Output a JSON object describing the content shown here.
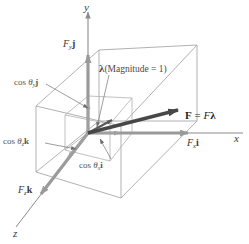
{
  "figure": {
    "background_color": "#ffffff",
    "axis_color": "#8c8c8c",
    "box_color": "#a8a8a8",
    "gray_arrow_color": "#9a9a9a",
    "dark_arrow_color": "#4a4a4a",
    "leader_color": "#7d7d7d"
  },
  "axes": {
    "x_label": "x",
    "y_label": "y",
    "z_label": "z"
  },
  "components": {
    "fx_label_prefix": "F",
    "fx_label_sub": "x",
    "fx_label_unit": "i",
    "fy_label_prefix": "F",
    "fy_label_sub": "y",
    "fy_label_unit": "j",
    "fz_label_prefix": "F",
    "fz_label_sub": "z",
    "fz_label_unit": "k"
  },
  "direction_cosines": {
    "cos_x_prefix": "cos ",
    "cos_x_theta": "θ",
    "cos_x_sub": "x",
    "cos_x_unit": "i",
    "cos_y_prefix": "cos ",
    "cos_y_theta": "θ",
    "cos_y_sub": "y",
    "cos_y_unit": "j",
    "cos_z_prefix": "cos ",
    "cos_z_theta": "θ",
    "cos_z_sub": "z",
    "cos_z_unit": "k"
  },
  "vectors": {
    "lambda_symbol": "λ",
    "lambda_note": "(Magnitude = 1)",
    "force_equation_F": "F",
    "force_equation_eq": " = ",
    "force_equation_Fscalar": "F",
    "force_equation_lambda": "λ"
  },
  "icons": {
    "arrowhead": "arrowhead-icon",
    "leader_line": "leader-line-icon"
  }
}
